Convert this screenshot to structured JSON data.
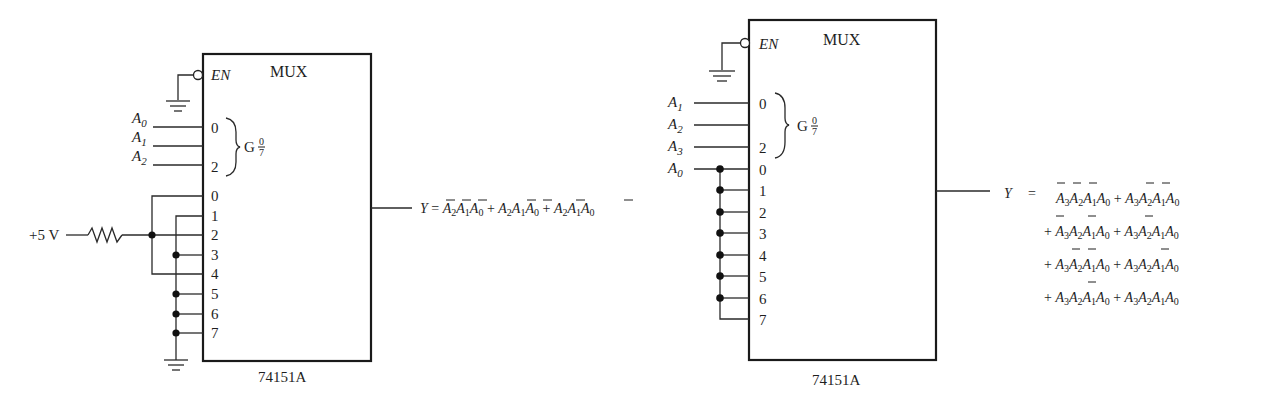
{
  "left_circuit": {
    "title": "MUX",
    "part_number": "74151A",
    "enable_label": "EN",
    "group_label": "G",
    "group_frac_top": "0",
    "group_frac_bottom": "7",
    "supply_label": "+5 V",
    "select_inputs": [
      {
        "name": "A",
        "sub": "0",
        "pin": "0"
      },
      {
        "name": "A",
        "sub": "1",
        "pin": ""
      },
      {
        "name": "A",
        "sub": "2",
        "pin": "2"
      }
    ],
    "data_pins": [
      "0",
      "1",
      "2",
      "3",
      "4",
      "5",
      "6",
      "7"
    ],
    "output": {
      "lhs": "Y",
      "equals": "=",
      "expression": "Y = A̅2A̅1A̅0 + A2A̅1A̅0 + A̅2A1A̅0"
    }
  },
  "right_circuit": {
    "title": "MUX",
    "part_number": "74151A",
    "enable_label": "EN",
    "group_label": "G",
    "group_frac_top": "0",
    "group_frac_bottom": "7",
    "select_inputs": [
      {
        "name": "A",
        "sub": "1",
        "pin": "0"
      },
      {
        "name": "A",
        "sub": "2",
        "pin": ""
      },
      {
        "name": "A",
        "sub": "3",
        "pin": "2"
      }
    ],
    "data_input": {
      "name": "A",
      "sub": "0"
    },
    "data_pins": [
      "0",
      "1",
      "2",
      "3",
      "4",
      "5",
      "6",
      "7"
    ],
    "output": {
      "lhs": "Y",
      "equals": "=",
      "plus": "+",
      "lines": [
        "A̅3A̅2A̅1A0 + A̅3A̅2A1A0",
        "+ A̅3A2A̅1A0 + A̅3A2A1A0",
        "+ A3A̅2A̅1A0 + A3A̅2A1A0",
        "+ A3A2A̅1A0 + A3A2A1A0"
      ]
    }
  }
}
